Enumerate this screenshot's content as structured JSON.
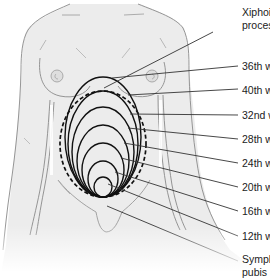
{
  "diagram": {
    "colors": {
      "skin": "#ebebeb",
      "outline": "#8a8a8a",
      "ellipse": "#111111",
      "leader": "#333333",
      "text": "#222222"
    },
    "labels": [
      {
        "id": "xiphoid",
        "line1": "Xiphoid",
        "line2": "process"
      },
      {
        "id": "w36",
        "line1": "36th week"
      },
      {
        "id": "w40",
        "line1": "40th week"
      },
      {
        "id": "w32",
        "line1": "32nd week"
      },
      {
        "id": "w28",
        "line1": "28th week"
      },
      {
        "id": "w24",
        "line1": "24th week"
      },
      {
        "id": "w20",
        "line1": "20th week"
      },
      {
        "id": "w16",
        "line1": "16th week"
      },
      {
        "id": "w12",
        "line1": "12th week"
      },
      {
        "id": "symphysis",
        "line1": "Symphysis",
        "line2": "pubis"
      }
    ],
    "fundal_outlines": [
      {
        "week": 12,
        "style": "solid"
      },
      {
        "week": 16,
        "style": "solid"
      },
      {
        "week": 20,
        "style": "solid"
      },
      {
        "week": 24,
        "style": "solid"
      },
      {
        "week": 28,
        "style": "solid"
      },
      {
        "week": 32,
        "style": "solid"
      },
      {
        "week": 36,
        "style": "solid"
      },
      {
        "week": 40,
        "style": "dashed"
      }
    ]
  }
}
